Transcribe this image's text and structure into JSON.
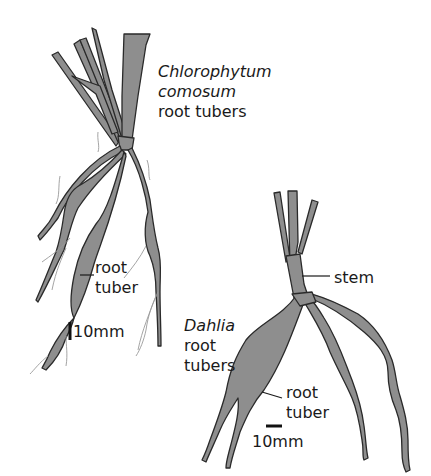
{
  "diagram": {
    "colors": {
      "fill": "#8e8e8e",
      "outline": "#2a2a2a",
      "text": "#1a1a1a",
      "fine_roots": "#9a9a9a"
    },
    "chlorophytum": {
      "title_line1": "Chlorophytum",
      "title_line2": "comosum",
      "title_line3": "root tubers",
      "label_root_tuber_1": "root",
      "label_root_tuber_2": "tuber",
      "scale_label": "10mm"
    },
    "dahlia": {
      "title_line1": "Dahlia",
      "title_line2": "root",
      "title_line3": "tubers",
      "label_stem": "stem",
      "label_root_tuber_1": "root",
      "label_root_tuber_2": "tuber",
      "scale_label": "10mm"
    }
  }
}
